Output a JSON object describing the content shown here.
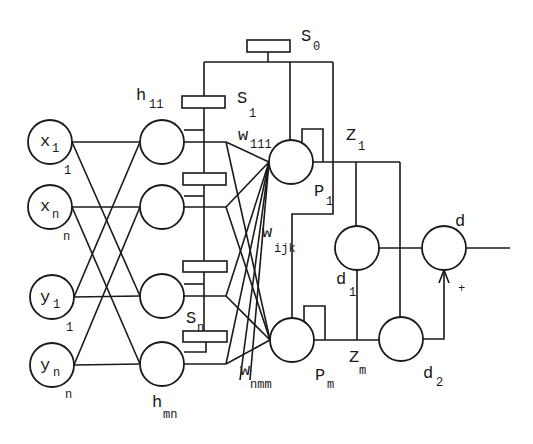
{
  "diagram": {
    "inputs": [
      {
        "name": "x",
        "sub": "1",
        "below": "1"
      },
      {
        "name": "x",
        "sub": "n",
        "below": "n"
      },
      {
        "name": "y",
        "sub": "1",
        "below": "1"
      },
      {
        "name": "y",
        "sub": "n",
        "below": "n"
      }
    ],
    "hidden_labels": {
      "top": {
        "name": "h",
        "sub": "11"
      },
      "bottom": {
        "name": "h",
        "sub": "mn"
      }
    },
    "switches": {
      "s0": {
        "name": "S",
        "sub": "0"
      },
      "s1": {
        "name": "S",
        "sub": "1"
      },
      "sn": {
        "name": "S",
        "sub": "n"
      }
    },
    "weights": {
      "w111": {
        "name": "w",
        "sub": "111"
      },
      "wijk": {
        "name": "w",
        "sub": "ijk"
      },
      "wnmm": {
        "name": "w",
        "sub": "nmm"
      }
    },
    "products": {
      "p1": {
        "name": "P",
        "sub": "1"
      },
      "pm": {
        "name": "P",
        "sub": "m"
      }
    },
    "z": {
      "z1": {
        "name": "Z",
        "sub": "1"
      },
      "zm": {
        "name": "Z",
        "sub": "m"
      }
    },
    "outputs": {
      "d1": {
        "name": "d",
        "sub": "1"
      },
      "d2": {
        "name": "d",
        "sub": "2"
      },
      "d": {
        "name": "d"
      },
      "plus": "+"
    }
  }
}
